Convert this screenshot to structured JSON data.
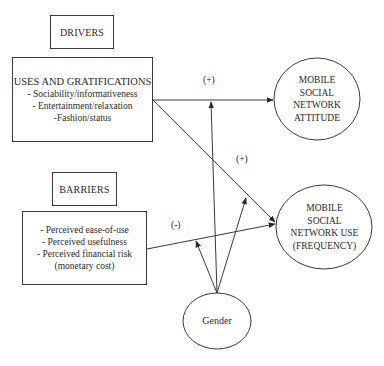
{
  "diagram": {
    "drivers": {
      "header": "DRIVERS",
      "title": "USES AND GRATIFICATIONS",
      "items": [
        "- Sociability/informativeness",
        "- Entertainment/relaxation",
        "-Fashion/status"
      ]
    },
    "barriers": {
      "header": "BARRIERS",
      "items": [
        "- Perceived ease-of-use",
        "- Perceived usefulness",
        "- Perceived financial risk",
        "(monetary cost)"
      ]
    },
    "outcomes": {
      "attitude": [
        "MOBILE",
        "SOCIAL",
        "NETWORK",
        "ATTITUDE"
      ],
      "use": [
        "MOBILE",
        "SOCIAL",
        "NETWORK USE",
        "(FREQUENCY)"
      ]
    },
    "moderator": {
      "label": "Gender"
    },
    "edge_signs": {
      "drivers_to_attitude": "(+)",
      "drivers_to_use": "(+)",
      "barriers_to_use": "(-)"
    },
    "colors": {
      "line": "#3a3a3a",
      "background": "#ffffff"
    }
  }
}
